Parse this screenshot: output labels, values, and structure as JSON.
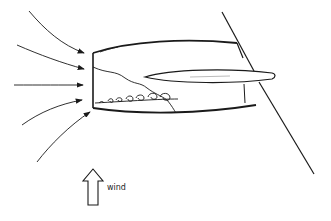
{
  "diagram": {
    "labels": {
      "wind": "wind"
    },
    "colors": {
      "stroke": "#1a1a1a",
      "background": "#ffffff"
    },
    "elements": [
      {
        "name": "airflow-streamlines",
        "count": 5
      },
      {
        "name": "nacelle",
        "parts": [
          "inlet-lip",
          "cowl",
          "separation-boundary",
          "vortices",
          "pylon-wing"
        ]
      },
      {
        "name": "wind-arrow",
        "direction": "up"
      }
    ]
  }
}
